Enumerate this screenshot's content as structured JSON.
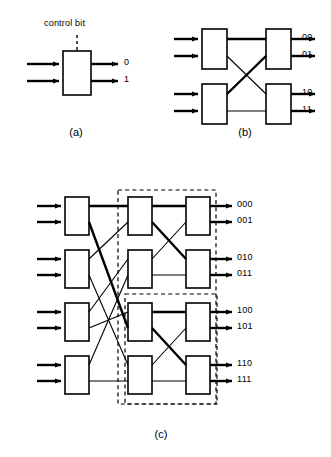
{
  "figure": {
    "title_present": false,
    "panels": [
      {
        "id": "a",
        "caption": "(a)",
        "control_label": "control bit",
        "output_labels": [
          "0",
          "1"
        ],
        "switch_count": 1,
        "inputs": 2,
        "outputs": 2
      },
      {
        "id": "b",
        "caption": "(b)",
        "output_labels": [
          "00",
          "01",
          "10",
          "11"
        ],
        "stages": 2,
        "switches_per_stage": 2,
        "inputs": 4,
        "outputs": 4
      },
      {
        "id": "c",
        "caption": "(c)",
        "output_labels": [
          "000",
          "001",
          "010",
          "011",
          "100",
          "101",
          "110",
          "111"
        ],
        "stages": 3,
        "switches_per_stage": 4,
        "inputs": 8,
        "outputs": 8,
        "dashed_groups": 2
      }
    ]
  },
  "colors": {
    "ink": "#000000",
    "paper": "#ffffff"
  },
  "icons": {
    "arrow": "arrow-right-icon",
    "switch": "switch-box-icon",
    "dashed_boundary": "dashed-boundary-icon"
  }
}
